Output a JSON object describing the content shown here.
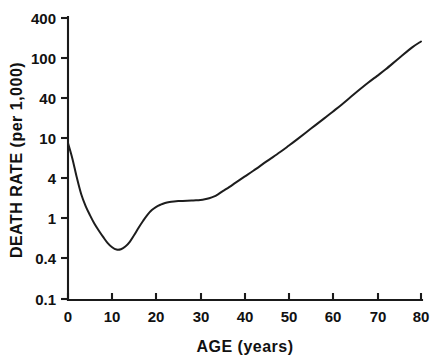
{
  "chart_data": {
    "type": "line",
    "title": "",
    "xlabel": "AGE (years)",
    "ylabel": "DEATH RATE (per 1,000)",
    "xlim": [
      0,
      80
    ],
    "ylim": [
      0.1,
      400
    ],
    "yscale": "log",
    "xscale": "linear",
    "grid": false,
    "legend": null,
    "xticks": [
      0,
      10,
      20,
      30,
      40,
      50,
      60,
      70,
      80
    ],
    "xtick_labels": [
      "0",
      "10",
      "20",
      "30",
      "40",
      "50",
      "60",
      "70",
      "80"
    ],
    "yticks": [
      0.1,
      0.4,
      1,
      4,
      10,
      40,
      100,
      400
    ],
    "ytick_labels": [
      "0.1",
      "0.4",
      "1",
      "4",
      "10",
      "40",
      "100",
      "400"
    ],
    "series": [
      {
        "name": "death rate",
        "x": [
          0,
          1,
          2,
          3,
          4,
          5,
          6,
          7,
          8,
          9,
          10,
          11,
          12,
          13,
          14,
          15,
          16,
          17,
          18,
          19,
          20,
          21,
          22,
          23,
          24,
          25,
          26,
          27,
          28,
          29,
          30,
          31,
          32,
          33,
          34,
          35,
          36,
          38,
          40,
          42,
          45,
          48,
          50,
          52,
          55,
          58,
          60,
          62,
          65,
          68,
          70,
          72,
          75,
          78,
          80
        ],
        "y": [
          10.0,
          6.3,
          3.6,
          2.2,
          1.55,
          1.18,
          0.92,
          0.75,
          0.62,
          0.52,
          0.46,
          0.43,
          0.435,
          0.47,
          0.54,
          0.66,
          0.82,
          1.0,
          1.2,
          1.38,
          1.52,
          1.62,
          1.7,
          1.75,
          1.78,
          1.8,
          1.81,
          1.82,
          1.83,
          1.84,
          1.86,
          1.9,
          1.96,
          2.05,
          2.2,
          2.4,
          2.6,
          3.1,
          3.7,
          4.4,
          5.8,
          7.6,
          9.2,
          11.2,
          15.2,
          20.5,
          25.2,
          31.0,
          43.0,
          59.0,
          72.0,
          88.0,
          122.0,
          168.0,
          200.0
        ]
      }
    ]
  },
  "axis": {
    "ylabel": "DEATH RATE (per 1,000)",
    "xlabel": "AGE (years)"
  }
}
